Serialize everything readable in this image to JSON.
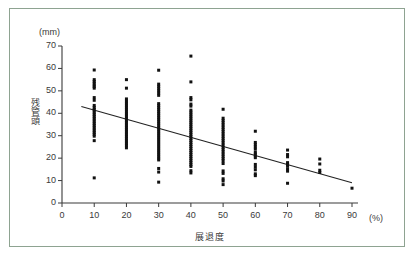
{
  "chart_data": {
    "type": "scatter",
    "title": "",
    "subtitle": "",
    "xlabel": "展退度",
    "ylabel": "残管頭",
    "x_unit": "(%)",
    "y_unit": "(mm)",
    "xlim": [
      0,
      90
    ],
    "ylim": [
      0,
      70
    ],
    "xticks": [
      0,
      10,
      20,
      30,
      40,
      50,
      60,
      70,
      80,
      90
    ],
    "yticks": [
      0,
      10,
      20,
      30,
      40,
      50,
      60,
      70
    ],
    "grid": false,
    "legend": null,
    "marker_color": "#111111",
    "axis_color": "#3a3a3a",
    "trendline": {
      "name": "regression line",
      "x": [
        6,
        90
      ],
      "y": [
        43.0,
        9.0
      ],
      "color": "#222222"
    },
    "series": [
      {
        "name": "残管頭 vs 展退度",
        "points": [
          [
            10,
            59.3
          ],
          [
            10,
            55.0
          ],
          [
            10,
            54.2
          ],
          [
            10,
            53.4
          ],
          [
            10,
            52.6
          ],
          [
            10,
            51.9
          ],
          [
            10,
            51.2
          ],
          [
            10,
            47.0
          ],
          [
            10,
            45.8
          ],
          [
            10,
            43.5
          ],
          [
            10,
            42.6
          ],
          [
            10,
            41.8
          ],
          [
            10,
            41.0
          ],
          [
            10,
            40.2
          ],
          [
            10,
            39.4
          ],
          [
            10,
            38.6
          ],
          [
            10,
            37.8
          ],
          [
            10,
            37.0
          ],
          [
            10,
            36.2
          ],
          [
            10,
            35.4
          ],
          [
            10,
            34.6
          ],
          [
            10,
            33.8
          ],
          [
            10,
            33.0
          ],
          [
            10,
            32.2
          ],
          [
            10,
            31.4
          ],
          [
            10,
            30.6
          ],
          [
            10,
            29.8
          ],
          [
            10,
            27.8
          ],
          [
            10,
            11.2
          ],
          [
            20,
            55.0
          ],
          [
            20,
            51.2
          ],
          [
            20,
            46.4
          ],
          [
            20,
            45.4
          ],
          [
            20,
            44.5
          ],
          [
            20,
            43.6
          ],
          [
            20,
            42.7
          ],
          [
            20,
            41.8
          ],
          [
            20,
            40.9
          ],
          [
            20,
            40.0
          ],
          [
            20,
            39.2
          ],
          [
            20,
            38.4
          ],
          [
            20,
            37.6
          ],
          [
            20,
            36.8
          ],
          [
            20,
            36.0
          ],
          [
            20,
            35.2
          ],
          [
            20,
            34.4
          ],
          [
            20,
            33.6
          ],
          [
            20,
            32.8
          ],
          [
            20,
            32.0
          ],
          [
            20,
            31.2
          ],
          [
            20,
            30.4
          ],
          [
            20,
            29.6
          ],
          [
            20,
            28.8
          ],
          [
            20,
            28.0
          ],
          [
            20,
            27.2
          ],
          [
            20,
            26.4
          ],
          [
            20,
            25.6
          ],
          [
            20,
            24.6
          ],
          [
            30,
            59.2
          ],
          [
            30,
            53.0
          ],
          [
            30,
            52.0
          ],
          [
            30,
            51.0
          ],
          [
            30,
            50.0
          ],
          [
            30,
            49.0
          ],
          [
            30,
            48.0
          ],
          [
            30,
            44.3
          ],
          [
            30,
            43.4
          ],
          [
            30,
            42.5
          ],
          [
            30,
            41.6
          ],
          [
            30,
            40.7
          ],
          [
            30,
            39.8
          ],
          [
            30,
            38.9
          ],
          [
            30,
            38.0
          ],
          [
            30,
            37.1
          ],
          [
            30,
            36.2
          ],
          [
            30,
            35.3
          ],
          [
            30,
            34.4
          ],
          [
            30,
            33.5
          ],
          [
            30,
            32.6
          ],
          [
            30,
            31.7
          ],
          [
            30,
            30.8
          ],
          [
            30,
            29.9
          ],
          [
            30,
            29.0
          ],
          [
            30,
            28.1
          ],
          [
            30,
            27.2
          ],
          [
            30,
            26.3
          ],
          [
            30,
            25.4
          ],
          [
            30,
            24.5
          ],
          [
            30,
            23.6
          ],
          [
            30,
            22.7
          ],
          [
            30,
            21.8
          ],
          [
            30,
            20.9
          ],
          [
            30,
            20.0
          ],
          [
            30,
            19.2
          ],
          [
            30,
            15.4
          ],
          [
            30,
            13.8
          ],
          [
            30,
            9.3
          ],
          [
            40,
            65.5
          ],
          [
            40,
            54.0
          ],
          [
            40,
            47.0
          ],
          [
            40,
            46.0
          ],
          [
            40,
            44.1
          ],
          [
            40,
            43.2
          ],
          [
            40,
            41.4
          ],
          [
            40,
            40.5
          ],
          [
            40,
            39.6
          ],
          [
            40,
            38.7
          ],
          [
            40,
            37.8
          ],
          [
            40,
            36.9
          ],
          [
            40,
            36.0
          ],
          [
            40,
            35.1
          ],
          [
            40,
            34.2
          ],
          [
            40,
            33.3
          ],
          [
            40,
            32.4
          ],
          [
            40,
            31.5
          ],
          [
            40,
            30.6
          ],
          [
            40,
            29.7
          ],
          [
            40,
            28.8
          ],
          [
            40,
            27.9
          ],
          [
            40,
            27.0
          ],
          [
            40,
            26.1
          ],
          [
            40,
            25.2
          ],
          [
            40,
            24.3
          ],
          [
            40,
            23.4
          ],
          [
            40,
            22.5
          ],
          [
            40,
            21.6
          ],
          [
            40,
            20.7
          ],
          [
            40,
            19.8
          ],
          [
            40,
            18.9
          ],
          [
            40,
            18.0
          ],
          [
            40,
            17.1
          ],
          [
            40,
            16.3
          ],
          [
            40,
            14.4
          ],
          [
            40,
            13.4
          ],
          [
            50,
            41.8
          ],
          [
            50,
            37.8
          ],
          [
            50,
            36.8
          ],
          [
            50,
            35.8
          ],
          [
            50,
            34.8
          ],
          [
            50,
            33.8
          ],
          [
            50,
            32.8
          ],
          [
            50,
            31.8
          ],
          [
            50,
            30.8
          ],
          [
            50,
            29.8
          ],
          [
            50,
            28.8
          ],
          [
            50,
            27.8
          ],
          [
            50,
            26.8
          ],
          [
            50,
            25.8
          ],
          [
            50,
            24.8
          ],
          [
            50,
            23.8
          ],
          [
            50,
            22.8
          ],
          [
            50,
            21.8
          ],
          [
            50,
            20.8
          ],
          [
            50,
            19.8
          ],
          [
            50,
            18.8
          ],
          [
            50,
            17.6
          ],
          [
            50,
            14.3
          ],
          [
            50,
            13.2
          ],
          [
            50,
            10.8
          ],
          [
            50,
            9.8
          ],
          [
            50,
            8.2
          ],
          [
            60,
            32.0
          ],
          [
            60,
            27.0
          ],
          [
            60,
            26.0
          ],
          [
            60,
            25.0
          ],
          [
            60,
            24.0
          ],
          [
            60,
            22.6
          ],
          [
            60,
            21.8
          ],
          [
            60,
            21.0
          ],
          [
            60,
            20.2
          ],
          [
            60,
            17.2
          ],
          [
            60,
            16.0
          ],
          [
            60,
            14.8
          ],
          [
            60,
            13.0
          ],
          [
            60,
            12.2
          ],
          [
            70,
            23.6
          ],
          [
            70,
            21.6
          ],
          [
            70,
            20.6
          ],
          [
            70,
            18.0
          ],
          [
            70,
            17.2
          ],
          [
            70,
            16.4
          ],
          [
            70,
            15.2
          ],
          [
            70,
            14.2
          ],
          [
            70,
            8.8
          ],
          [
            80,
            19.6
          ],
          [
            80,
            17.4
          ],
          [
            80,
            14.6
          ],
          [
            80,
            13.6
          ],
          [
            90,
            6.6
          ]
        ]
      }
    ]
  },
  "axis": {
    "y_unit_label": "(mm)",
    "x_unit_label": "(%)",
    "y_title": "残管頭",
    "x_title": "展退度",
    "y_tick_labels": [
      "0",
      "10",
      "20",
      "30",
      "40",
      "50",
      "60",
      "70"
    ],
    "x_tick_labels": [
      "0",
      "10",
      "20",
      "30",
      "40",
      "50",
      "60",
      "70",
      "80",
      "90"
    ]
  }
}
